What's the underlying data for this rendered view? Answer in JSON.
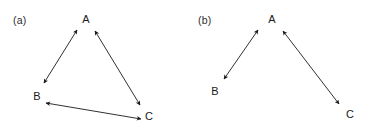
{
  "figure": {
    "width": 372,
    "height": 134,
    "background_color": "#ffffff",
    "stroke_color": "#1a1a1a",
    "text_color": "#1a1a1a"
  },
  "panels": [
    {
      "id": "a",
      "caption": "(a)",
      "caption_x": 13,
      "caption_y": 15,
      "nodes": [
        {
          "id": "A",
          "label": "A",
          "x": 85,
          "y": 20
        },
        {
          "id": "B",
          "label": "B",
          "x": 36,
          "y": 97
        },
        {
          "id": "C",
          "label": "C",
          "x": 148,
          "y": 117
        }
      ],
      "edges": [
        {
          "id": "a-edge-ab",
          "from": "B",
          "to": "A",
          "arrowheads": "both",
          "x1": 44,
          "y1": 83,
          "x2": 77,
          "y2": 30
        },
        {
          "id": "a-edge-ac",
          "from": "A",
          "to": "C",
          "arrowheads": "both",
          "x1": 95,
          "y1": 31,
          "x2": 140,
          "y2": 105
        },
        {
          "id": "a-edge-bc",
          "from": "B",
          "to": "C",
          "arrowheads": "both",
          "x1": 46,
          "y1": 103,
          "x2": 141,
          "y2": 119
        }
      ]
    },
    {
      "id": "b",
      "caption": "(b)",
      "caption_x": 12,
      "caption_y": 15,
      "nodes": [
        {
          "id": "A",
          "label": "A",
          "x": 85,
          "y": 20
        },
        {
          "id": "B",
          "label": "B",
          "x": 28,
          "y": 92
        },
        {
          "id": "C",
          "label": "C",
          "x": 163,
          "y": 115
        }
      ],
      "edges": [
        {
          "id": "b-edge-ab",
          "from": "B",
          "to": "A",
          "arrowheads": "both",
          "x1": 38,
          "y1": 79,
          "x2": 72,
          "y2": 30
        },
        {
          "id": "b-edge-ac",
          "from": "A",
          "to": "C",
          "arrowheads": "both",
          "x1": 97,
          "y1": 31,
          "x2": 153,
          "y2": 104
        }
      ]
    }
  ]
}
